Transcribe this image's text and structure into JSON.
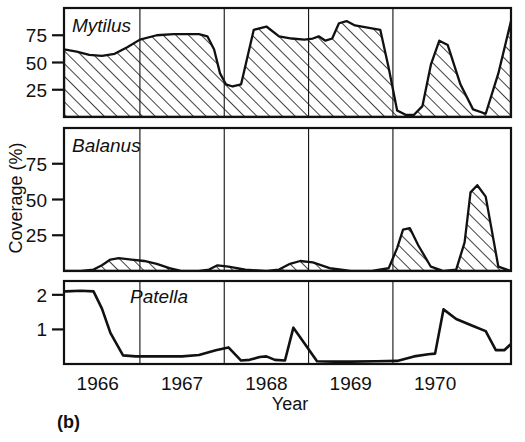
{
  "figure": {
    "caption": "(b)",
    "y_axis_title": "Coverage (%)",
    "x_axis_title": "Year"
  },
  "chart_data": {
    "type": "area",
    "title": "",
    "subtitle": "",
    "xlabel": "Year",
    "ylabel": "Coverage (%)",
    "grid": true,
    "legend_position": "in-panel",
    "x_tick_labels": [
      "1966",
      "1967",
      "1968",
      "1969",
      "1970"
    ],
    "x_tick_values": [
      1966,
      1967,
      1968,
      1969,
      1970
    ],
    "xlim": [
      1965.6,
      1970.9
    ],
    "panels": [
      {
        "name": "Mytilus",
        "type": "area",
        "ylabel": "Coverage (%)",
        "ylim": [
          0,
          100
        ],
        "y_tick_labels": [
          "25",
          "50",
          "75"
        ],
        "y_tick_values": [
          25,
          50,
          75
        ],
        "x": [
          1965.6,
          1965.75,
          1965.9,
          1966.05,
          1966.2,
          1966.35,
          1966.5,
          1966.7,
          1966.9,
          1967.05,
          1967.2,
          1967.3,
          1967.38,
          1967.45,
          1967.52,
          1967.6,
          1967.7,
          1967.85,
          1968.0,
          1968.15,
          1968.3,
          1968.45,
          1968.55,
          1968.62,
          1968.7,
          1968.78,
          1968.86,
          1968.95,
          1969.05,
          1969.2,
          1969.35,
          1969.45,
          1969.55,
          1969.65,
          1969.75,
          1969.85,
          1969.95,
          1970.05,
          1970.15,
          1970.3,
          1970.45,
          1970.6,
          1970.75,
          1970.9
        ],
        "y": [
          62,
          60,
          57,
          56,
          58,
          64,
          71,
          75,
          76,
          76,
          76,
          74,
          62,
          40,
          30,
          28,
          30,
          80,
          83,
          74,
          72,
          71,
          72,
          74,
          70,
          72,
          86,
          88,
          84,
          82,
          80,
          45,
          6,
          2,
          2,
          10,
          48,
          70,
          66,
          30,
          7,
          3,
          40,
          88
        ]
      },
      {
        "name": "Balanus",
        "type": "area",
        "ylabel": "Coverage (%)",
        "ylim": [
          0,
          100
        ],
        "y_tick_labels": [
          "25",
          "50",
          "75"
        ],
        "y_tick_values": [
          25,
          50,
          75
        ],
        "x": [
          1965.6,
          1965.8,
          1965.95,
          1966.05,
          1966.15,
          1966.25,
          1966.4,
          1966.55,
          1966.7,
          1966.85,
          1967.0,
          1967.2,
          1967.32,
          1967.42,
          1967.55,
          1967.75,
          1968.0,
          1968.15,
          1968.28,
          1968.4,
          1968.55,
          1968.75,
          1969.0,
          1969.25,
          1969.45,
          1969.55,
          1969.62,
          1969.7,
          1969.8,
          1969.95,
          1970.1,
          1970.25,
          1970.35,
          1970.42,
          1970.5,
          1970.6,
          1970.75,
          1970.9
        ],
        "y": [
          0,
          0,
          1,
          4,
          8,
          9,
          8,
          7,
          5,
          2,
          0,
          0,
          1,
          4,
          3,
          1,
          0,
          1,
          5,
          7,
          6,
          2,
          0,
          0,
          2,
          16,
          29,
          30,
          18,
          3,
          0,
          1,
          20,
          55,
          60,
          52,
          3,
          0
        ]
      },
      {
        "name": "Patella",
        "type": "line",
        "ylabel": "Coverage (%)",
        "ylim": [
          0,
          2.4
        ],
        "y_tick_labels": [
          "1",
          "2"
        ],
        "y_tick_values": [
          1,
          2
        ],
        "x": [
          1965.62,
          1965.8,
          1965.95,
          1966.05,
          1966.15,
          1966.3,
          1966.45,
          1966.7,
          1967.0,
          1967.2,
          1967.4,
          1967.55,
          1967.7,
          1967.8,
          1967.92,
          1968.0,
          1968.1,
          1968.22,
          1968.32,
          1968.45,
          1968.6,
          1968.8,
          1969.0,
          1969.3,
          1969.55,
          1969.75,
          1969.92,
          1970.0,
          1970.1,
          1970.25,
          1970.45,
          1970.6,
          1970.72,
          1970.82,
          1970.9
        ],
        "y": [
          2.1,
          2.12,
          2.1,
          1.6,
          0.9,
          0.25,
          0.22,
          0.22,
          0.22,
          0.26,
          0.4,
          0.48,
          0.1,
          0.12,
          0.2,
          0.22,
          0.12,
          0.1,
          1.05,
          0.6,
          0.08,
          0.07,
          0.07,
          0.08,
          0.09,
          0.22,
          0.28,
          0.3,
          1.58,
          1.3,
          1.1,
          0.95,
          0.4,
          0.4,
          0.58
        ]
      }
    ]
  }
}
